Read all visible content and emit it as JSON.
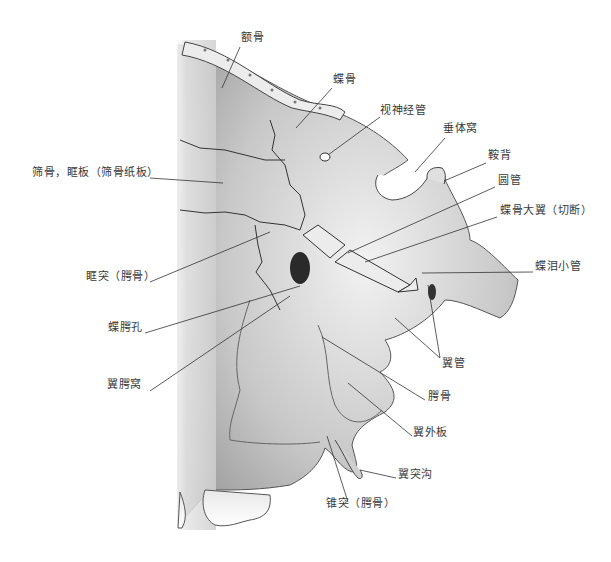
{
  "figure": {
    "background": "#ffffff",
    "bone_color": "#d9d9d9",
    "line_color": "#333333"
  },
  "labels": [
    {
      "id": "frontal-bone",
      "text": "额骨",
      "x": 241,
      "y": 37
    },
    {
      "id": "sphenoid-bone",
      "text": "蝶骨",
      "x": 333,
      "y": 79
    },
    {
      "id": "optic-canal",
      "text": "视神经管",
      "x": 380,
      "y": 110
    },
    {
      "id": "hypophyseal-fossa",
      "text": "垂体窝",
      "x": 443,
      "y": 128
    },
    {
      "id": "ethmoid-orbital-plate",
      "text": "筛骨，眶板（筛骨纸板）",
      "x": 32,
      "y": 172
    },
    {
      "id": "dorsum-sellae",
      "text": "鞍背",
      "x": 488,
      "y": 155
    },
    {
      "id": "foramen-rotundum",
      "text": "圆管",
      "x": 498,
      "y": 180
    },
    {
      "id": "greater-wing-cut",
      "text": "蝶骨大翼（切断）",
      "x": 500,
      "y": 210
    },
    {
      "id": "orbital-process-palatine",
      "text": "眶突（腭骨）",
      "x": 86,
      "y": 276
    },
    {
      "id": "palatovaginal-canal",
      "text": "蝶泪小管",
      "x": 535,
      "y": 266
    },
    {
      "id": "sphenopalatine-foramen",
      "text": "蝶腭孔",
      "x": 108,
      "y": 327
    },
    {
      "id": "pterygoid-canal",
      "text": "翼管",
      "x": 442,
      "y": 363
    },
    {
      "id": "pterygopalatine-fossa",
      "text": "翼腭窝",
      "x": 107,
      "y": 384
    },
    {
      "id": "palatine-bone",
      "text": "腭骨",
      "x": 428,
      "y": 396
    },
    {
      "id": "lateral-pterygoid-plate",
      "text": "翼外板",
      "x": 413,
      "y": 432
    },
    {
      "id": "pterygoid-hamulus-groove",
      "text": "翼突沟",
      "x": 398,
      "y": 474
    },
    {
      "id": "pyramidal-process-palatine",
      "text": "锥突（腭骨）",
      "x": 326,
      "y": 503
    }
  ]
}
